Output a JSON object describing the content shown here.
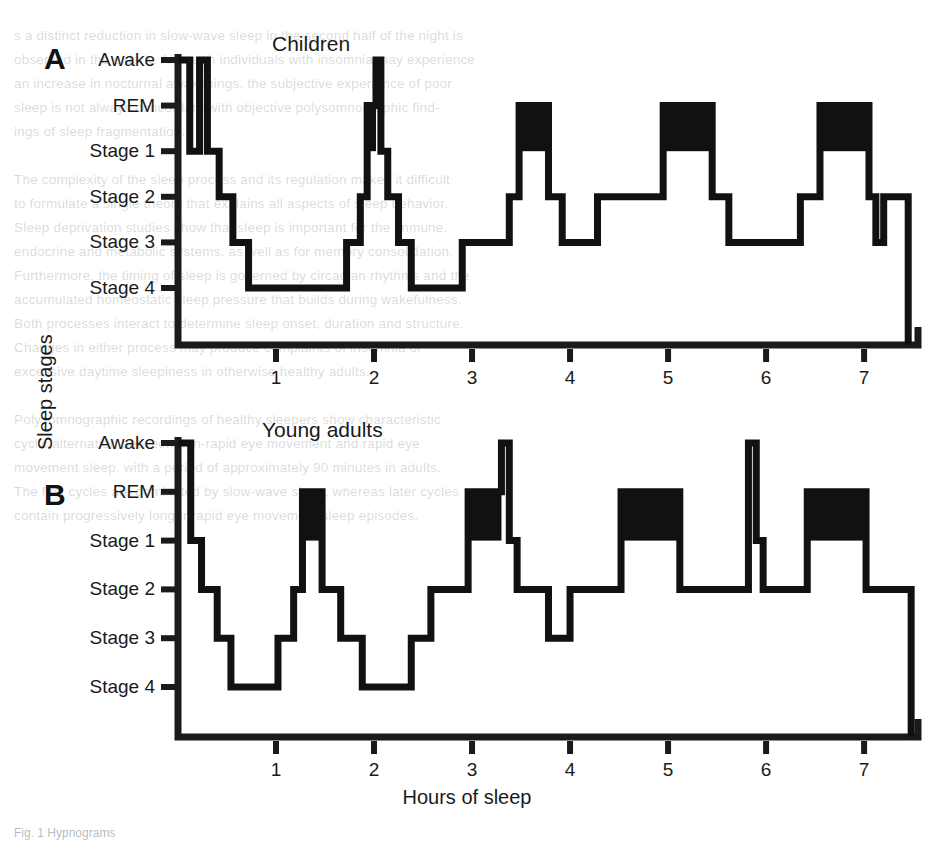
{
  "figure": {
    "y_axis_title": "Sleep stages",
    "x_axis_title": "Hours of sleep",
    "caption": "Fig. 1 Hypnograms"
  },
  "stage_labels": [
    "Awake",
    "REM",
    "Stage 1",
    "Stage 2",
    "Stage 3",
    "Stage 4"
  ],
  "x_tick_labels": [
    "1",
    "2",
    "3",
    "4",
    "5",
    "6",
    "7"
  ],
  "panels": [
    {
      "letter": "A",
      "title": "Children"
    },
    {
      "letter": "B",
      "title": "Young adults"
    }
  ],
  "bleed_text": [
    {
      "x": 14,
      "y": 28,
      "t": "s a distinct reduction in slow-wave sleep in the second half of the night is"
    },
    {
      "x": 14,
      "y": 52,
      "t": "observed in the elderly. Although individuals with insomnia may experience"
    },
    {
      "x": 14,
      "y": 76,
      "t": "an increase in nocturnal awakenings, the subjective experience of poor"
    },
    {
      "x": 14,
      "y": 100,
      "t": "sleep is not always concordant with objective polysomnographic find-"
    },
    {
      "x": 14,
      "y": 124,
      "t": "ings of sleep fragmentation."
    },
    {
      "x": 14,
      "y": 172,
      "t": "The complexity of the sleep process and its regulation makes it difficult"
    },
    {
      "x": 14,
      "y": 196,
      "t": "to formulate a single theory that explains all aspects of sleep behavior."
    },
    {
      "x": 14,
      "y": 220,
      "t": "Sleep deprivation studies show that sleep is important for the immune,"
    },
    {
      "x": 14,
      "y": 244,
      "t": "endocrine and metabolic systems, as well as for memory consolidation."
    },
    {
      "x": 14,
      "y": 268,
      "t": "Furthermore, the timing of sleep is governed by circadian rhythms and the"
    },
    {
      "x": 14,
      "y": 292,
      "t": "accumulated homeostatic sleep pressure that builds during wakefulness."
    },
    {
      "x": 14,
      "y": 316,
      "t": "Both processes interact to determine sleep onset, duration and structure."
    },
    {
      "x": 14,
      "y": 340,
      "t": "Changes in either process may produce complaints of insomnia or"
    },
    {
      "x": 14,
      "y": 364,
      "t": "excessive daytime sleepiness in otherwise healthy adults."
    },
    {
      "x": 14,
      "y": 412,
      "t": "Polysomnographic recordings of healthy sleepers show characteristic"
    },
    {
      "x": 14,
      "y": 436,
      "t": "cyclic alternation between non-rapid eye movement and rapid eye"
    },
    {
      "x": 14,
      "y": 460,
      "t": "movement sleep, with a period of approximately 90 minutes in adults."
    },
    {
      "x": 14,
      "y": 484,
      "t": "The first cycles are dominated by slow-wave sleep, whereas later cycles"
    },
    {
      "x": 14,
      "y": 508,
      "t": "contain progressively longer rapid eye movement sleep episodes."
    }
  ],
  "chart_data": {
    "type": "line",
    "xlabel": "Hours of sleep",
    "ylabel": "Sleep stages",
    "xlim": [
      0,
      7.55
    ],
    "x_ticks": [
      1,
      2,
      3,
      4,
      5,
      6,
      7
    ],
    "y_categories": [
      "Awake",
      "REM",
      "Stage 1",
      "Stage 2",
      "Stage 3",
      "Stage 4"
    ],
    "y_levels": {
      "Awake": 0,
      "REM": 1,
      "Stage 1": 2,
      "Stage 2": 3,
      "Stage 3": 4,
      "Stage 4": 5
    },
    "grid": false,
    "legend": "none",
    "series": [
      {
        "name": "Children",
        "panel": "A",
        "steps": [
          {
            "x0": 0.0,
            "x1": 0.12,
            "stage": "Awake"
          },
          {
            "x0": 0.12,
            "x1": 0.22,
            "stage": "Stage 1"
          },
          {
            "x0": 0.22,
            "x1": 0.3,
            "stage": "Awake"
          },
          {
            "x0": 0.3,
            "x1": 0.42,
            "stage": "Stage 1"
          },
          {
            "x0": 0.42,
            "x1": 0.56,
            "stage": "Stage 2"
          },
          {
            "x0": 0.56,
            "x1": 0.72,
            "stage": "Stage 3"
          },
          {
            "x0": 0.72,
            "x1": 1.72,
            "stage": "Stage 4"
          },
          {
            "x0": 1.72,
            "x1": 1.86,
            "stage": "Stage 3"
          },
          {
            "x0": 1.86,
            "x1": 1.93,
            "stage": "Stage 2"
          },
          {
            "x0": 1.93,
            "x1": 2.02,
            "stage": "REM"
          },
          {
            "x0": 2.02,
            "x1": 2.07,
            "stage": "Awake"
          },
          {
            "x0": 2.07,
            "x1": 2.14,
            "stage": "Stage 1"
          },
          {
            "x0": 2.14,
            "x1": 2.25,
            "stage": "Stage 2"
          },
          {
            "x0": 2.25,
            "x1": 2.38,
            "stage": "Stage 3"
          },
          {
            "x0": 2.38,
            "x1": 2.9,
            "stage": "Stage 4"
          },
          {
            "x0": 2.9,
            "x1": 3.38,
            "stage": "Stage 3"
          },
          {
            "x0": 3.38,
            "x1": 3.48,
            "stage": "Stage 2"
          },
          {
            "x0": 3.48,
            "x1": 3.78,
            "stage": "REM"
          },
          {
            "x0": 3.78,
            "x1": 3.92,
            "stage": "Stage 2"
          },
          {
            "x0": 3.92,
            "x1": 4.28,
            "stage": "Stage 3"
          },
          {
            "x0": 4.28,
            "x1": 4.95,
            "stage": "Stage 2"
          },
          {
            "x0": 4.95,
            "x1": 5.45,
            "stage": "REM"
          },
          {
            "x0": 5.45,
            "x1": 5.62,
            "stage": "Stage 2"
          },
          {
            "x0": 5.62,
            "x1": 6.35,
            "stage": "Stage 3"
          },
          {
            "x0": 6.35,
            "x1": 6.55,
            "stage": "Stage 2"
          },
          {
            "x0": 6.55,
            "x1": 7.05,
            "stage": "REM"
          },
          {
            "x0": 7.05,
            "x1": 7.12,
            "stage": "Stage 2"
          },
          {
            "x0": 7.12,
            "x1": 7.2,
            "stage": "Stage 3"
          },
          {
            "x0": 7.2,
            "x1": 7.45,
            "stage": "Stage 2"
          }
        ],
        "rem_blocks": [
          {
            "x0": 1.93,
            "x1": 2.02
          },
          {
            "x0": 3.48,
            "x1": 3.78
          },
          {
            "x0": 4.95,
            "x1": 5.45
          },
          {
            "x0": 6.55,
            "x1": 7.05
          }
        ]
      },
      {
        "name": "Young adults",
        "panel": "B",
        "steps": [
          {
            "x0": 0.0,
            "x1": 0.13,
            "stage": "Awake"
          },
          {
            "x0": 0.13,
            "x1": 0.24,
            "stage": "Stage 1"
          },
          {
            "x0": 0.24,
            "x1": 0.4,
            "stage": "Stage 2"
          },
          {
            "x0": 0.4,
            "x1": 0.54,
            "stage": "Stage 3"
          },
          {
            "x0": 0.54,
            "x1": 1.02,
            "stage": "Stage 4"
          },
          {
            "x0": 1.02,
            "x1": 1.18,
            "stage": "Stage 3"
          },
          {
            "x0": 1.18,
            "x1": 1.27,
            "stage": "Stage 2"
          },
          {
            "x0": 1.27,
            "x1": 1.47,
            "stage": "REM"
          },
          {
            "x0": 1.47,
            "x1": 1.66,
            "stage": "Stage 2"
          },
          {
            "x0": 1.66,
            "x1": 1.88,
            "stage": "Stage 3"
          },
          {
            "x0": 1.88,
            "x1": 2.38,
            "stage": "Stage 4"
          },
          {
            "x0": 2.38,
            "x1": 2.58,
            "stage": "Stage 3"
          },
          {
            "x0": 2.58,
            "x1": 2.96,
            "stage": "Stage 2"
          },
          {
            "x0": 2.96,
            "x1": 3.3,
            "stage": "REM"
          },
          {
            "x0": 3.3,
            "x1": 3.38,
            "stage": "Awake"
          },
          {
            "x0": 3.38,
            "x1": 3.46,
            "stage": "Stage 1"
          },
          {
            "x0": 3.46,
            "x1": 3.78,
            "stage": "Stage 2"
          },
          {
            "x0": 3.78,
            "x1": 4.0,
            "stage": "Stage 3"
          },
          {
            "x0": 4.0,
            "x1": 4.52,
            "stage": "Stage 2"
          },
          {
            "x0": 4.52,
            "x1": 5.12,
            "stage": "REM"
          },
          {
            "x0": 5.12,
            "x1": 5.82,
            "stage": "Stage 2"
          },
          {
            "x0": 5.82,
            "x1": 5.9,
            "stage": "Awake"
          },
          {
            "x0": 5.9,
            "x1": 5.97,
            "stage": "Stage 1"
          },
          {
            "x0": 5.97,
            "x1": 6.42,
            "stage": "Stage 2"
          },
          {
            "x0": 6.42,
            "x1": 7.02,
            "stage": "REM"
          },
          {
            "x0": 7.02,
            "x1": 7.48,
            "stage": "Stage 2"
          }
        ],
        "rem_blocks": [
          {
            "x0": 1.27,
            "x1": 1.47
          },
          {
            "x0": 2.96,
            "x1": 3.3
          },
          {
            "x0": 4.52,
            "x1": 5.12
          },
          {
            "x0": 6.42,
            "x1": 7.02
          }
        ]
      }
    ]
  }
}
